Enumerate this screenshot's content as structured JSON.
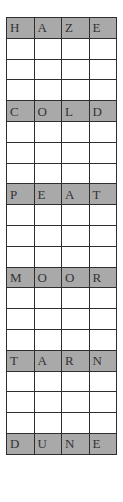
{
  "puzzle": {
    "type": "word-ladder",
    "columns": 4,
    "colors": {
      "filled_cell": "#a9a9a9",
      "empty_cell": "#ffffff",
      "border": "#2e2e2e",
      "text": "#333333"
    },
    "rows": [
      {
        "kind": "word",
        "letters": [
          "H",
          "A",
          "Z",
          "E"
        ]
      },
      {
        "kind": "blank",
        "letters": [
          "",
          "",
          "",
          ""
        ]
      },
      {
        "kind": "blank",
        "letters": [
          "",
          "",
          "",
          ""
        ]
      },
      {
        "kind": "blank",
        "letters": [
          "",
          "",
          "",
          ""
        ]
      },
      {
        "kind": "word",
        "letters": [
          "C",
          "O",
          "L",
          "D"
        ]
      },
      {
        "kind": "blank",
        "letters": [
          "",
          "",
          "",
          ""
        ]
      },
      {
        "kind": "blank",
        "letters": [
          "",
          "",
          "",
          ""
        ]
      },
      {
        "kind": "blank",
        "letters": [
          "",
          "",
          "",
          ""
        ]
      },
      {
        "kind": "word",
        "letters": [
          "P",
          "E",
          "A",
          "T"
        ]
      },
      {
        "kind": "blank",
        "letters": [
          "",
          "",
          "",
          ""
        ]
      },
      {
        "kind": "blank",
        "letters": [
          "",
          "",
          "",
          ""
        ]
      },
      {
        "kind": "blank",
        "letters": [
          "",
          "",
          "",
          ""
        ]
      },
      {
        "kind": "word",
        "letters": [
          "M",
          "O",
          "O",
          "R"
        ]
      },
      {
        "kind": "blank",
        "letters": [
          "",
          "",
          "",
          ""
        ]
      },
      {
        "kind": "blank",
        "letters": [
          "",
          "",
          "",
          ""
        ]
      },
      {
        "kind": "blank",
        "letters": [
          "",
          "",
          "",
          ""
        ]
      },
      {
        "kind": "word",
        "letters": [
          "T",
          "A",
          "R",
          "N"
        ]
      },
      {
        "kind": "blank",
        "letters": [
          "",
          "",
          "",
          ""
        ]
      },
      {
        "kind": "blank",
        "letters": [
          "",
          "",
          "",
          ""
        ]
      },
      {
        "kind": "blank",
        "letters": [
          "",
          "",
          "",
          ""
        ]
      },
      {
        "kind": "word",
        "letters": [
          "D",
          "U",
          "N",
          "E"
        ]
      }
    ]
  }
}
